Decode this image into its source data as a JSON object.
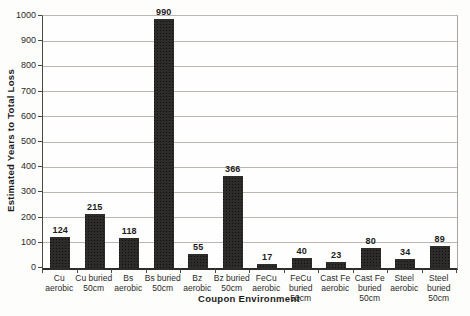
{
  "chart_data": {
    "type": "bar",
    "title": "",
    "xlabel": "Coupon Environment",
    "ylabel": "Estimated Years to Total Loss",
    "ylim": [
      0,
      1000
    ],
    "ytick_step": 100,
    "grid": true,
    "legend": false,
    "bar_color": "#2e2c2b",
    "categories": [
      "Cu aerobic",
      "Cu buried 50cm",
      "Bs aerobic",
      "Bs buried 50cm",
      "Bz aerobic",
      "Bz buried 50cm",
      "FeCu aerobic",
      "FeCu buried 50cm",
      "Cast Fe aerobic",
      "Cast Fe buried 50cm",
      "Steel aerobic",
      "Steel buried 50cm"
    ],
    "category_label_lines": [
      [
        "Cu",
        "aerobic"
      ],
      [
        "Cu buried",
        "50cm"
      ],
      [
        "Bs",
        "aerobic"
      ],
      [
        "Bs buried",
        "50cm"
      ],
      [
        "Bz",
        "aerobic"
      ],
      [
        "Bz buried",
        "50cm"
      ],
      [
        "FeCu",
        "aerobic"
      ],
      [
        "FeCu",
        "buried",
        "50cm"
      ],
      [
        "Cast Fe",
        "aerobic"
      ],
      [
        "Cast Fe",
        "buried",
        "50cm"
      ],
      [
        "Steel",
        "aerobic"
      ],
      [
        "Steel",
        "buried",
        "50cm"
      ]
    ],
    "values": [
      124,
      215,
      118,
      990,
      55,
      366,
      17,
      40,
      23,
      80,
      34,
      89
    ],
    "value_labels_shown": true
  }
}
